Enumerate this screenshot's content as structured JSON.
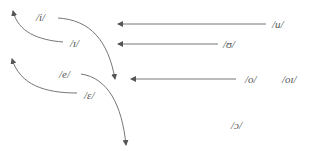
{
  "diagram": {
    "type": "vowel-shift-diagram",
    "line_color": "#555555",
    "text_color": "#555555",
    "labels": {
      "i": "/i/",
      "ih": "/ɪ/",
      "e": "/e/",
      "eh": "/ɛ/",
      "u": "/u/",
      "uh": "/ʊ/",
      "o": "/o/",
      "oi": "/oɪ/",
      "open_o": "/ɔ/"
    },
    "arrows": [
      {
        "from": "/ɪ/",
        "direction": "curve up-left"
      },
      {
        "from": "/i/",
        "direction": "curve down-right"
      },
      {
        "from": "/ɛ/",
        "direction": "curve up-left"
      },
      {
        "from": "/e/",
        "direction": "curve down-right"
      },
      {
        "from": "/u/",
        "direction": "left"
      },
      {
        "from": "/ʊ/",
        "direction": "left"
      },
      {
        "from": "/o/",
        "direction": "left"
      }
    ]
  }
}
